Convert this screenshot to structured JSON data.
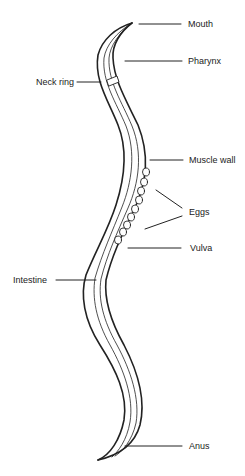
{
  "diagram": {
    "labels": [
      {
        "id": "mouth",
        "text": "Mouth"
      },
      {
        "id": "pharynx",
        "text": "Pharynx"
      },
      {
        "id": "neck_ring",
        "text": "Neck ring"
      },
      {
        "id": "muscle_wall",
        "text": "Muscle wall"
      },
      {
        "id": "eggs",
        "text": "Eggs"
      },
      {
        "id": "vulva",
        "text": "Vulva"
      },
      {
        "id": "intestine",
        "text": "Intestine"
      },
      {
        "id": "anus",
        "text": "Anus"
      }
    ],
    "colors": {
      "stroke": "#222222",
      "background": "#ffffff"
    }
  }
}
